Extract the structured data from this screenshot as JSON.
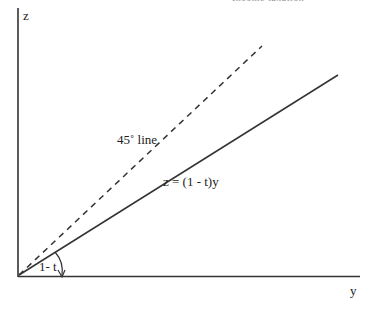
{
  "header": {
    "title": "Income taxation"
  },
  "diagram": {
    "axes": {
      "vertical_label": "z",
      "horizontal_label": "y"
    },
    "lines": [
      {
        "name": "45-degree line",
        "label": "45˚ line",
        "style": "dashed"
      },
      {
        "name": "tax line",
        "label": "z = (1 - t)y",
        "style": "solid"
      }
    ],
    "angle_label": "1- t"
  }
}
